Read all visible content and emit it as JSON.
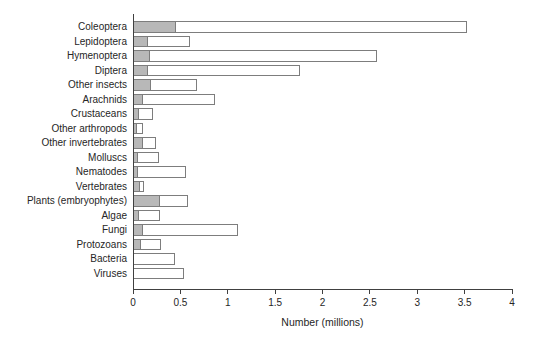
{
  "chart_data": {
    "type": "bar",
    "orientation": "horizontal",
    "title": "",
    "xlabel": "Number (millions)",
    "ylabel": "",
    "xlim": [
      0,
      4
    ],
    "xtick_labels": [
      "0",
      "0.5",
      "1",
      "1.5",
      "2",
      "2.5",
      "3",
      "3.5",
      "4"
    ],
    "grid": false,
    "legend_position": "none",
    "categories": [
      "Coleoptera",
      "Lepidoptera",
      "Hymenoptera",
      "Diptera",
      "Other insects",
      "Arachnids",
      "Crustaceans",
      "Other arthropods",
      "Other invertebrates",
      "Molluscs",
      "Nematodes",
      "Vertebrates",
      "Plants (embryophytes)",
      "Algae",
      "Fungi",
      "Protozoans",
      "Bacteria",
      "Viruses"
    ],
    "series": [
      {
        "name": "shaded-segment-described-species",
        "values": [
          0.44,
          0.15,
          0.17,
          0.15,
          0.18,
          0.09,
          0.05,
          0.03,
          0.1,
          0.04,
          0.04,
          0.06,
          0.27,
          0.05,
          0.1,
          0.07,
          0.0,
          0.0
        ]
      },
      {
        "name": "open-bar-estimated-total-species",
        "values": [
          3.51,
          0.59,
          2.56,
          1.75,
          0.66,
          0.85,
          0.2,
          0.1,
          0.23,
          0.26,
          0.55,
          0.11,
          0.57,
          0.27,
          1.1,
          0.28,
          0.43,
          0.53
        ]
      }
    ],
    "colors": {
      "background": "#ffffff",
      "open_bar_fill": "#ffffff",
      "shaded_bar_fill": "#b8b8b8",
      "bar_stroke": "#7d7d7d",
      "axis": "#404040",
      "text": "#262626"
    }
  }
}
